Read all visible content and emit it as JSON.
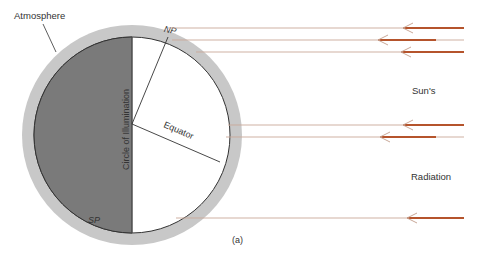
{
  "labels": {
    "atmosphere": "Atmosphere",
    "north_pole": "NP",
    "south_pole": "SP",
    "circle_of_illumination": "Circle of Illumination",
    "equator": "Equator",
    "suns": "Sun's",
    "radiation": "Radiation",
    "figure_label": "(a)"
  },
  "colors": {
    "atmosphere": "#c8c8c8",
    "dark_side": "#7a7a7a",
    "lit_side": "#ffffff",
    "outline": "#333333",
    "ray_thin": "#c9a898",
    "ray_thick": "#b5542c"
  },
  "rays": [
    {
      "name": "ray-1"
    },
    {
      "name": "ray-2"
    },
    {
      "name": "ray-3"
    },
    {
      "name": "ray-4"
    },
    {
      "name": "ray-5"
    },
    {
      "name": "ray-6"
    }
  ]
}
